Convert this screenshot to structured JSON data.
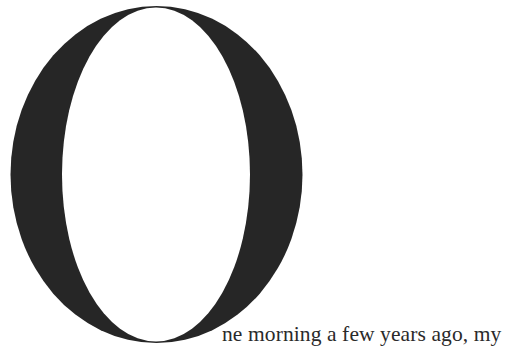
{
  "drop_cap": {
    "letter": "O",
    "color": "#262626"
  },
  "paragraph": {
    "first_line_text": "ne morning a few years ago, my"
  }
}
